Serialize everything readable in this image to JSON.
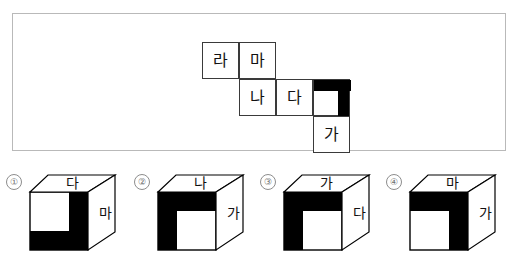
{
  "problem": {
    "net": {
      "title": "cube-net-diagram",
      "cells": [
        {
          "id": "ra",
          "label": "라",
          "col": 1,
          "row": 1,
          "black": "none"
        },
        {
          "id": "ma",
          "label": "마",
          "col": 2,
          "row": 1,
          "black": "none"
        },
        {
          "id": "na",
          "label": "나",
          "col": 2,
          "row": 2,
          "black": "none"
        },
        {
          "id": "da",
          "label": "다",
          "col": 3,
          "row": 2,
          "black": "none"
        },
        {
          "id": "pattern",
          "label": "",
          "col": 4,
          "row": 2,
          "black": "top-right-L"
        },
        {
          "id": "ga",
          "label": "가",
          "col": 4,
          "row": 3,
          "black": "none"
        }
      ]
    }
  },
  "options": [
    {
      "number": "①",
      "top_face": "다",
      "right_face": "마",
      "front_black": "right-column-and-bottom-row"
    },
    {
      "number": "②",
      "top_face": "나",
      "right_face": "가",
      "front_black": "top-row-and-left-column"
    },
    {
      "number": "③",
      "top_face": "가",
      "right_face": "다",
      "front_black": "top-row-and-left-column"
    },
    {
      "number": "④",
      "top_face": "마",
      "right_face": "가",
      "front_black": "top-row-and-right-column"
    }
  ],
  "colors": {
    "ink": "#111111",
    "fill_black": "#000000",
    "panel_border": "#b9b9b9",
    "cell_border": "#3a3a3a",
    "number_circle": "#8d8d8d"
  }
}
